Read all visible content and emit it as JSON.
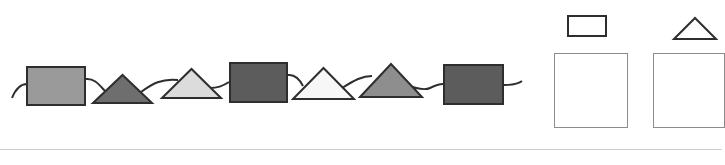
{
  "title": "",
  "sequence": {
    "string_color": "#2e2e2e",
    "items": [
      {
        "shape": "square",
        "fill": "#9a9a9a",
        "x": 26,
        "y": 66,
        "w": 60,
        "h": 40
      },
      {
        "shape": "triangle",
        "fill": "#6e6e6e",
        "x": 92,
        "y": 74,
        "w": 61,
        "h": 30
      },
      {
        "shape": "triangle",
        "fill": "#dcdcdc",
        "x": 161,
        "y": 68,
        "w": 61,
        "h": 31
      },
      {
        "shape": "square",
        "fill": "#5c5c5c",
        "x": 229,
        "y": 62,
        "w": 59,
        "h": 41
      },
      {
        "shape": "triangle",
        "fill": "#f7f7f7",
        "x": 292,
        "y": 67,
        "w": 63,
        "h": 33
      },
      {
        "shape": "triangle",
        "fill": "#8e8e8e",
        "x": 359,
        "y": 63,
        "w": 64,
        "h": 35
      },
      {
        "shape": "square",
        "fill": "#5c5c5c",
        "x": 443,
        "y": 64,
        "w": 61,
        "h": 41
      }
    ]
  },
  "answer_area": {
    "boxes": [
      {
        "hint_shape": "rectangle",
        "x": 554,
        "y": 53,
        "w": 74,
        "h": 75
      },
      {
        "hint_shape": "triangle",
        "x": 653,
        "y": 53,
        "w": 72,
        "h": 75
      }
    ],
    "hints": [
      {
        "shape": "rectangle",
        "x": 567,
        "y": 15,
        "w": 40,
        "h": 22
      },
      {
        "shape": "triangle",
        "x": 673,
        "y": 17,
        "w": 44,
        "h": 23
      }
    ]
  },
  "divider_color": "#cfcfcf"
}
